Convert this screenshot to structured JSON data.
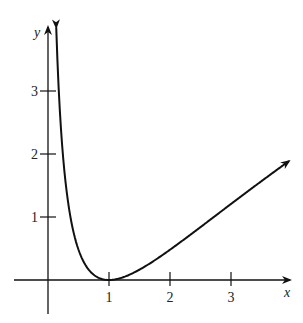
{
  "chart_data": {
    "type": "line",
    "title": "",
    "function": "y = (ln x)^2",
    "xlabel": "x",
    "ylabel": "y",
    "xlim": [
      -0.5,
      4.0
    ],
    "ylim": [
      -0.5,
      4.0
    ],
    "x_ticks": [
      1,
      2,
      3
    ],
    "x_tick_labels": [
      "1",
      "2",
      "3"
    ],
    "y_ticks": [
      1,
      2,
      3
    ],
    "y_tick_labels": [
      "1",
      "2",
      "3"
    ],
    "grid": false,
    "legend": null,
    "series": [
      {
        "name": "curve",
        "color": "#111111",
        "x": [
          0.135,
          0.15,
          0.2,
          0.243,
          0.3,
          0.39,
          0.5,
          0.6,
          0.7,
          0.8,
          0.9,
          1.0,
          1.2,
          1.5,
          2.0,
          2.5,
          3.0,
          3.5,
          3.95
        ],
        "y": [
          4.0,
          3.6,
          2.59,
          2.0,
          1.45,
          0.89,
          0.48,
          0.26,
          0.127,
          0.05,
          0.011,
          0.0,
          0.033,
          0.164,
          0.48,
          0.84,
          1.21,
          1.57,
          1.89
        ]
      }
    ],
    "annotations": [
      "curve has arrowheads at both ends",
      "axes have arrowheads on positive ends"
    ]
  },
  "colors": {
    "ink": "#111111",
    "background": "#ffffff"
  }
}
